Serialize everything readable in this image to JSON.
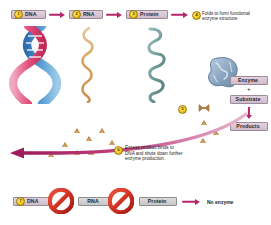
{
  "diagram": {
    "background_color": "#ffffff",
    "accent_color": "#b6246c",
    "badge_color": "#f2c820"
  },
  "top_pathway": {
    "steps": [
      {
        "number": "1",
        "label": "DNA",
        "molecule": "dna-double-helix"
      },
      {
        "number": "2",
        "label": "RNA",
        "molecule": "rna-strand"
      },
      {
        "number": "3",
        "label": "Protein",
        "molecule": "protein-chain"
      }
    ],
    "step4": {
      "number": "4",
      "text": "Folds to form functional\nenzyme structure"
    }
  },
  "reaction": {
    "step5_number": "5",
    "enzyme_label": "Enzyme",
    "plus_sign": "+",
    "substrate_label": "Substrate",
    "products_label": "Products"
  },
  "feedback": {
    "number": "6",
    "text": "Excess product binds to\nDNA and shuts down further\nenzyme production."
  },
  "bottom_pathway": {
    "number": "7",
    "items": [
      {
        "label": "DNA"
      },
      {
        "label": "RNA"
      },
      {
        "label": "Protein"
      }
    ],
    "blocked_icon": "prohibition-sign",
    "result_label": "No enzyme"
  },
  "molecule_colors": {
    "dna_strand_a": "#3f86c7",
    "dna_strand_b": "#e2527f",
    "rna": "#d9a15e",
    "protein": "#6f9a99",
    "enzyme_blob": "#8fa9c4",
    "product_triangle": "#b5803f",
    "prohibition": "#d03024"
  }
}
